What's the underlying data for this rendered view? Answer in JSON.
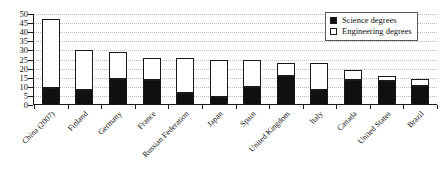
{
  "chart_data": {
    "type": "bar",
    "stacked": true,
    "title": "",
    "subtitle": "",
    "xlabel": "",
    "ylabel": "",
    "ylim": [
      0,
      50
    ],
    "ytick_step": 5,
    "yticks": [
      0,
      5,
      10,
      15,
      20,
      25,
      30,
      35,
      40,
      45,
      50
    ],
    "grid": "horizontal-dotted",
    "legend_position": "top-right",
    "categories": [
      "China (2007)",
      "Finland",
      "Germany",
      "France",
      "Russian Federation",
      "Japan",
      "Spain",
      "United Kingdom",
      "Italy",
      "Canada",
      "United States",
      "Brazil"
    ],
    "series": [
      {
        "name": "Science degrees",
        "color": "#101010",
        "values": [
          9.5,
          8.5,
          14.5,
          14,
          6.5,
          4.5,
          10,
          16,
          8,
          14,
          13,
          10.5
        ]
      },
      {
        "name": "Engineering degrees",
        "color": "#ffffff",
        "values": [
          37.5,
          21.5,
          14.5,
          12,
          19.5,
          20.5,
          15,
          7,
          15,
          5,
          3,
          4
        ]
      }
    ],
    "totals": [
      47,
      30,
      29,
      26,
      26,
      25,
      25,
      23,
      23,
      19,
      16,
      14.5
    ]
  },
  "legend": {
    "items": [
      {
        "label": "Science degrees",
        "swatch": "filled-square"
      },
      {
        "label": "Engineering degrees",
        "swatch": "open-square"
      }
    ]
  }
}
